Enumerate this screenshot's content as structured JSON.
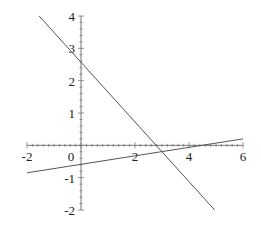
{
  "chart_data": {
    "type": "line",
    "title": "",
    "xlabel": "",
    "ylabel": "",
    "xlim": [
      -2,
      6
    ],
    "ylim": [
      -2,
      4
    ],
    "grid": false,
    "legend": null,
    "x_ticks": [
      "-2",
      "0",
      "2",
      "4",
      "6"
    ],
    "y_ticks": [
      "4",
      "3",
      "2",
      "1",
      "-1",
      "-2"
    ],
    "series": [
      {
        "name": "line-1",
        "x": [
          -1.55,
          4.95
        ],
        "y": [
          4.0,
          -2.0
        ],
        "slope": -0.87,
        "intercept": 2.6,
        "color": "#555555"
      },
      {
        "name": "line-2",
        "x": [
          -2,
          6
        ],
        "y": [
          -0.85,
          0.2
        ],
        "slope": 0.13,
        "intercept": -0.6,
        "color": "#555555"
      }
    ]
  }
}
